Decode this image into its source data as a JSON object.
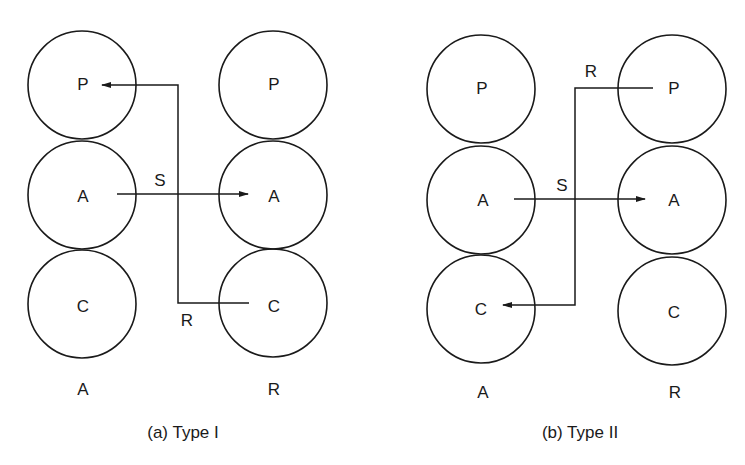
{
  "panels": [
    {
      "id": "a",
      "caption": "(a) Type I",
      "left_column_label": "A",
      "right_column_label": "R",
      "left_circles": [
        "P",
        "A",
        "C"
      ],
      "right_circles": [
        "P",
        "A",
        "C"
      ],
      "arrows": [
        {
          "label": "S",
          "from": "left A",
          "to": "right A"
        },
        {
          "label": "R",
          "from": "right C",
          "to": "left P"
        }
      ]
    },
    {
      "id": "b",
      "caption": "(b) Type II",
      "left_column_label": "A",
      "right_column_label": "R",
      "left_circles": [
        "P",
        "A",
        "C"
      ],
      "right_circles": [
        "P",
        "A",
        "C"
      ],
      "arrows": [
        {
          "label": "S",
          "from": "left A",
          "to": "right A"
        },
        {
          "label": "R",
          "from": "right P",
          "to": "left C"
        }
      ]
    }
  ]
}
